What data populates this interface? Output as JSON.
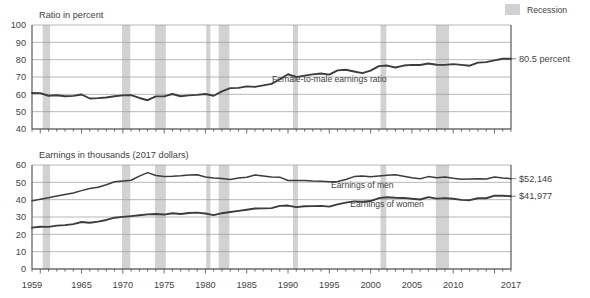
{
  "legend": {
    "recession_label": "Recession",
    "swatch_color": "#d2d2d2"
  },
  "panels": {
    "top": {
      "axis_title": "Ratio in percent",
      "series_label": "Female-to-male earnings ratio",
      "end_value_label": "80.5 percent",
      "y_ticks": [
        "100",
        "90",
        "80",
        "70",
        "60",
        "50",
        "40"
      ]
    },
    "bottom": {
      "axis_title": "Earnings in thousands (2017 dollars)",
      "series_label_men": "Earnings of men",
      "series_label_women": "Earnings of women",
      "end_value_men": "$52,146",
      "end_value_women": "$41,977",
      "y_ticks": [
        "60",
        "50",
        "40",
        "30",
        "20",
        "10",
        "0"
      ]
    }
  },
  "x_ticks": [
    "1959",
    "1965",
    "1970",
    "1975",
    "1980",
    "1985",
    "1990",
    "1995",
    "2000",
    "2005",
    "2010",
    "2017"
  ],
  "chart_data": {
    "type": "line",
    "title": "",
    "panels": [
      {
        "name": "ratio-panel",
        "ylabel": "Ratio in percent",
        "ylim": [
          40,
          100
        ],
        "ytick_step": 10,
        "grid": true,
        "xlabel": "",
        "xlim": [
          1959,
          2017
        ],
        "series": [
          {
            "name": "Female-to-male earnings ratio",
            "color": "#3c3c3c",
            "x": [
              1959,
              1960,
              1961,
              1962,
              1963,
              1964,
              1965,
              1966,
              1967,
              1968,
              1969,
              1970,
              1971,
              1972,
              1973,
              1974,
              1975,
              1976,
              1977,
              1978,
              1979,
              1980,
              1981,
              1982,
              1983,
              1984,
              1985,
              1986,
              1987,
              1988,
              1989,
              1990,
              1991,
              1992,
              1993,
              1994,
              1995,
              1996,
              1997,
              1998,
              1999,
              2000,
              2001,
              2002,
              2003,
              2004,
              2005,
              2006,
              2007,
              2008,
              2009,
              2010,
              2011,
              2012,
              2013,
              2014,
              2015,
              2016,
              2017
            ],
            "values": [
              60.8,
              60.7,
              59.2,
              59.5,
              58.9,
              59.1,
              59.9,
              57.6,
              57.8,
              58.2,
              58.9,
              59.4,
              59.5,
              57.9,
              56.6,
              58.8,
              58.8,
              60.2,
              58.9,
              59.4,
              59.7,
              60.2,
              59.2,
              61.7,
              63.6,
              63.7,
              64.6,
              64.3,
              65.2,
              66.0,
              68.7,
              71.6,
              69.9,
              70.8,
              71.5,
              72.0,
              71.4,
              73.8,
              74.2,
              73.2,
              72.2,
              73.7,
              76.3,
              76.6,
              75.5,
              76.6,
              77.0,
              76.9,
              77.8,
              77.1,
              77.0,
              77.4,
              77.0,
              76.5,
              78.3,
              78.6,
              79.6,
              80.5,
              80.5
            ]
          }
        ],
        "annotations": [
          {
            "text": "Female-to-male earnings ratio",
            "x": 1995,
            "y": 67
          },
          {
            "text": "80.5 percent",
            "x": 2017,
            "y": 80.5,
            "position": "right-edge"
          }
        ]
      },
      {
        "name": "earnings-panel",
        "ylabel": "Earnings in thousands (2017 dollars)",
        "ylim": [
          0,
          60
        ],
        "ytick_step": 10,
        "grid": true,
        "xlabel": "",
        "xlim": [
          1959,
          2017
        ],
        "series": [
          {
            "name": "Earnings of men",
            "color": "#4a4a4a",
            "x": [
              1959,
              1960,
              1961,
              1962,
              1963,
              1964,
              1965,
              1966,
              1967,
              1968,
              1969,
              1970,
              1971,
              1972,
              1973,
              1974,
              1975,
              1976,
              1977,
              1978,
              1979,
              1980,
              1981,
              1982,
              1983,
              1984,
              1985,
              1986,
              1987,
              1988,
              1989,
              1990,
              1991,
              1992,
              1993,
              1994,
              1995,
              1996,
              1997,
              1998,
              1999,
              2000,
              2001,
              2002,
              2003,
              2004,
              2005,
              2006,
              2007,
              2008,
              2009,
              2010,
              2011,
              2012,
              2013,
              2014,
              2015,
              2016,
              2017
            ],
            "values": [
              39.3,
              40.3,
              41.1,
              42.1,
              43.0,
              43.9,
              45.2,
              46.4,
              47.2,
              48.6,
              50.3,
              50.7,
              51.2,
              53.6,
              55.6,
              53.9,
              53.4,
              53.5,
              53.8,
              54.3,
              54.4,
              53.1,
              52.5,
              52.2,
              51.7,
              52.5,
              52.9,
              54.2,
              53.6,
              53.1,
              53.0,
              51.1,
              51.0,
              51.1,
              50.7,
              50.6,
              50.4,
              50.5,
              51.6,
              53.3,
              53.7,
              53.2,
              53.6,
              54.1,
              54.4,
              53.5,
              52.6,
              52.1,
              53.3,
              52.6,
              53.1,
              52.3,
              51.8,
              51.9,
              52.1,
              51.9,
              53.1,
              52.5,
              52.1
            ]
          },
          {
            "name": "Earnings of women",
            "color": "#3c3c3c",
            "x": [
              1959,
              1960,
              1961,
              1962,
              1963,
              1964,
              1965,
              1966,
              1967,
              1968,
              1969,
              1970,
              1971,
              1972,
              1973,
              1974,
              1975,
              1976,
              1977,
              1978,
              1979,
              1980,
              1981,
              1982,
              1983,
              1984,
              1985,
              1986,
              1987,
              1988,
              1989,
              1990,
              1991,
              1992,
              1993,
              1994,
              1995,
              1996,
              1997,
              1998,
              1999,
              2000,
              2001,
              2002,
              2003,
              2004,
              2005,
              2006,
              2007,
              2008,
              2009,
              2010,
              2011,
              2012,
              2013,
              2014,
              2015,
              2016,
              2017
            ],
            "values": [
              23.9,
              24.4,
              24.3,
              25.0,
              25.3,
              25.9,
              27.1,
              26.7,
              27.3,
              28.3,
              29.6,
              30.1,
              30.5,
              31.0,
              31.5,
              31.7,
              31.4,
              32.2,
              31.7,
              32.3,
              32.5,
              32.0,
              31.1,
              32.2,
              32.9,
              33.5,
              34.2,
              34.9,
              35.0,
              35.1,
              36.4,
              36.6,
              35.7,
              36.2,
              36.3,
              36.4,
              36.0,
              37.3,
              38.3,
              39.0,
              38.8,
              39.2,
              40.9,
              41.4,
              41.1,
              41.0,
              40.5,
              40.1,
              41.5,
              40.6,
              40.9,
              40.5,
              39.9,
              39.7,
              40.8,
              40.8,
              42.3,
              42.3,
              42.0
            ]
          }
        ],
        "annotations": [
          {
            "text": "Earnings of men",
            "x": 1999,
            "y": 47
          },
          {
            "text": "Earnings of women",
            "x": 2002,
            "y": 36
          },
          {
            "text": "$52,146",
            "x": 2017,
            "y": 52.1,
            "position": "right-edge"
          },
          {
            "text": "$41,977",
            "x": 2017,
            "y": 42.0,
            "position": "right-edge"
          }
        ]
      }
    ],
    "recessions": [
      {
        "start": 1960.3,
        "end": 1961.2
      },
      {
        "start": 1969.9,
        "end": 1970.9
      },
      {
        "start": 1973.9,
        "end": 1975.2
      },
      {
        "start": 1980.1,
        "end": 1980.6
      },
      {
        "start": 1981.6,
        "end": 1982.9
      },
      {
        "start": 1990.6,
        "end": 1991.2
      },
      {
        "start": 2001.2,
        "end": 2001.9
      },
      {
        "start": 2007.9,
        "end": 2009.5
      }
    ],
    "legend": [
      {
        "label": "Recession",
        "color": "#d2d2d2",
        "type": "band"
      }
    ]
  }
}
